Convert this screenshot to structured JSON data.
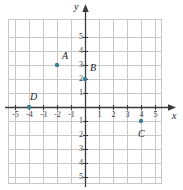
{
  "chart_data": {
    "type": "scatter",
    "title": "",
    "xlabel": "x",
    "ylabel": "y",
    "xlim": [
      -5.5,
      5.5
    ],
    "ylim": [
      -5.5,
      5.5
    ],
    "grid": true,
    "grid_step": 1,
    "legend": "none",
    "axes_arrows": true,
    "xticks": [
      -5,
      -4,
      -3,
      -2,
      -1,
      1,
      2,
      3,
      4,
      5
    ],
    "xtick_labels": [
      "-5",
      "-4",
      "-3",
      "-2",
      "-1",
      "1",
      "2",
      "3",
      "4",
      "5"
    ],
    "yticks": [
      5,
      4,
      3,
      2,
      1,
      -1,
      -2,
      -3,
      -4,
      -5
    ],
    "ytick_labels": [
      "5",
      "4",
      "3",
      "2",
      "1",
      "1",
      "2",
      "3",
      "4",
      "5"
    ],
    "points": [
      {
        "label": "A",
        "x": -2,
        "y": 3,
        "label_dx": 10,
        "label_dy": -10
      },
      {
        "label": "B",
        "x": 0,
        "y": 2,
        "label_dx": 10,
        "label_dy": -12
      },
      {
        "label": "C",
        "x": 4,
        "y": -1,
        "label_dx": 2,
        "label_dy": 12
      },
      {
        "label": "D",
        "x": -4,
        "y": 0,
        "label_dx": 6,
        "label_dy": -11
      }
    ],
    "point_color": "#3a7f93",
    "grid_color": "#c8c8c8",
    "axis_color": "#3a3a3a",
    "label_color": "#1a1a1a"
  },
  "plot_geometry": {
    "origin_x": 85,
    "origin_y": 107,
    "unit": 14,
    "grid_left": 8,
    "grid_top": 19,
    "grid_right": 162,
    "grid_bottom": 184
  },
  "axis_names": {
    "x": "x",
    "y": "y"
  }
}
